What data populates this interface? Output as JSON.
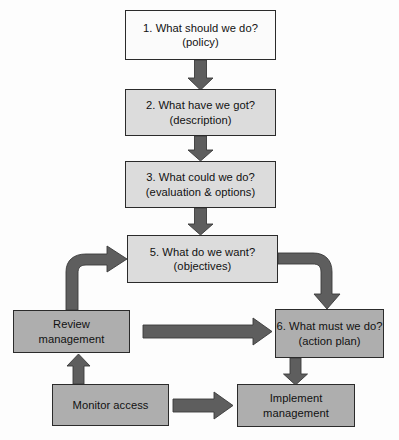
{
  "diagram": {
    "palette": {
      "box_white": "#fbfbfb",
      "box_light_gray": "#dcdcdc",
      "box_mid_gray": "#aeaeae",
      "arrow_gray": "#5e5e5e",
      "arrow_outline": "#3a3a3a",
      "border": "#2b2b2b",
      "text": "#111111",
      "background": "#fdfdfd"
    },
    "nodes": [
      {
        "id": "1",
        "line1": "1. What should we do?",
        "line2": "(policy)",
        "tone": "white"
      },
      {
        "id": "2",
        "line1": "2. What have we got?",
        "line2": "(description)",
        "tone": "light"
      },
      {
        "id": "3",
        "line1": "3. What could we do?",
        "line2": "(evaluation & options)",
        "tone": "light"
      },
      {
        "id": "5",
        "line1": "5. What do we want?",
        "line2": "(objectives)",
        "tone": "light"
      },
      {
        "id": "6",
        "line1": "6. What must we do?",
        "line2": "(action plan)",
        "tone": "mid"
      },
      {
        "id": "review",
        "line1": "Review",
        "line2": "management",
        "tone": "mid"
      },
      {
        "id": "monitor",
        "line1": "Monitor access",
        "line2": "",
        "tone": "mid"
      },
      {
        "id": "implement",
        "line1": "Implement",
        "line2": "management",
        "tone": "mid"
      }
    ],
    "connectors": [
      {
        "name": "arrow-1-to-2",
        "from": "1",
        "to": "2",
        "shape": "straight-down"
      },
      {
        "name": "arrow-2-to-3",
        "from": "2",
        "to": "3",
        "shape": "straight-down"
      },
      {
        "name": "arrow-3-to-5",
        "from": "3",
        "to": "5",
        "shape": "straight-down"
      },
      {
        "name": "arrow-review-to-5",
        "from": "review",
        "to": "5",
        "shape": "curve-up-right"
      },
      {
        "name": "arrow-5-to-6",
        "from": "5",
        "to": "6",
        "shape": "curve-right-down"
      },
      {
        "name": "arrow-review-to-6",
        "from": "review",
        "to": "6",
        "shape": "straight-right"
      },
      {
        "name": "arrow-monitor-to-review",
        "from": "monitor",
        "to": "review",
        "shape": "straight-up"
      },
      {
        "name": "arrow-monitor-to-implement",
        "from": "monitor",
        "to": "implement",
        "shape": "straight-right"
      },
      {
        "name": "arrow-6-to-implement",
        "from": "6",
        "to": "implement",
        "shape": "straight-down"
      }
    ]
  }
}
